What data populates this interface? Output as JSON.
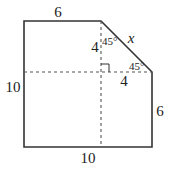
{
  "diagram": {
    "type": "geometry-figure",
    "colors": {
      "line": "#333333",
      "dash": "#555555",
      "text": "#222222"
    },
    "labels": {
      "top": "6",
      "left": "10",
      "bottom": "10",
      "right": "6",
      "hypotenuse": "x",
      "vertical_leg": "4",
      "horizontal_leg": "4",
      "angle_top": "45°",
      "angle_right": "45°"
    }
  }
}
